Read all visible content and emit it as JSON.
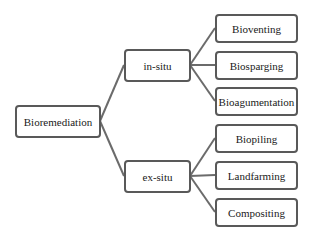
{
  "diagram": {
    "type": "tree",
    "root": {
      "id": "bioremediation",
      "label": "Bioremediation"
    },
    "branches": [
      {
        "id": "in-situ",
        "label": "in-situ",
        "children": [
          {
            "id": "bioventing",
            "label": "Bioventing"
          },
          {
            "id": "biosparging",
            "label": "Biosparging"
          },
          {
            "id": "bioagumentation",
            "label": "Bioagumentation"
          }
        ]
      },
      {
        "id": "ex-situ",
        "label": "ex-situ",
        "children": [
          {
            "id": "biopiling",
            "label": "Biopiling"
          },
          {
            "id": "landfarming",
            "label": "Landfarming"
          },
          {
            "id": "compositing",
            "label": "Compositing"
          }
        ]
      }
    ],
    "colors": {
      "border": "#595959",
      "connector": "#6b6b6b",
      "text": "#1a1a1a",
      "background": "#ffffff"
    }
  }
}
